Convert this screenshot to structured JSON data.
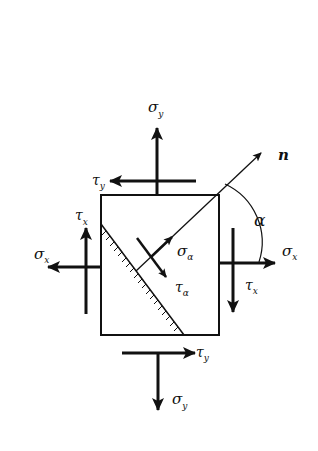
{
  "diagram": {
    "type": "plane stress element with inclined section",
    "colors": {
      "ink": "#111111",
      "background": "#ffffff"
    },
    "element_box": {
      "x": 101,
      "y": 195,
      "width": 118,
      "height": 140
    },
    "labels": {
      "sigma_y_top": {
        "symbol": "σ",
        "sub": "y"
      },
      "tau_y_top": {
        "symbol": "τ",
        "sub": "y"
      },
      "tau_x_left": {
        "symbol": "τ",
        "sub": "x"
      },
      "sigma_x_left": {
        "symbol": "σ",
        "sub": "x"
      },
      "sigma_x_right": {
        "symbol": "σ",
        "sub": "x"
      },
      "tau_x_right": {
        "symbol": "τ",
        "sub": "x"
      },
      "tau_y_bottom": {
        "symbol": "τ",
        "sub": "y"
      },
      "sigma_y_bottom": {
        "symbol": "σ",
        "sub": "y"
      },
      "sigma_alpha": {
        "symbol": "σ",
        "sub": "α"
      },
      "tau_alpha": {
        "symbol": "τ",
        "sub": "α"
      },
      "normal": {
        "symbol": "n"
      },
      "angle": {
        "symbol": "α"
      }
    }
  }
}
